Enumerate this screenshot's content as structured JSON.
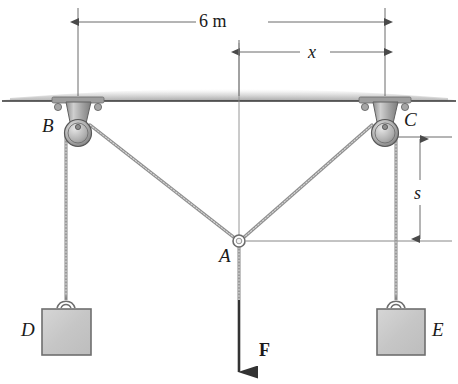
{
  "figure": {
    "colors": {
      "line": "#2b2b2b",
      "dim_line": "#5a5a5a",
      "cable": "#8a8a8a",
      "block_fill": "#c9c9c9",
      "block_stroke": "#6e6e6e",
      "pulley_fill": "#b5b5b5",
      "pulley_stroke": "#555555",
      "ceiling": "#333333",
      "hatch": "#b9b9b9"
    }
  },
  "labels": {
    "point_b": "B",
    "point_c": "C",
    "point_a": "A",
    "block_d": "D",
    "block_e": "E",
    "force": "F"
  },
  "dimensions": {
    "span": {
      "label": "6 m",
      "value": 6,
      "unit": "m",
      "from": "B",
      "to": "C"
    },
    "horizontal_offset": {
      "label": "x",
      "from": "centerline",
      "to": "C"
    },
    "vertical_drop": {
      "label": "s",
      "from": "C",
      "to": "A"
    }
  },
  "geometry": {
    "ceiling_y": 101,
    "pulley_b_x": 78,
    "pulley_c_x": 385,
    "point_a": {
      "x": 238,
      "y": 241
    },
    "centerline_x": 239,
    "span_dim_y": 22,
    "x_dim_y": 52,
    "s_dim_x": 420,
    "block_top_y": 310,
    "block_bottom_y": 355,
    "block_d_x": [
      42,
      91
    ],
    "block_e_x": [
      377,
      425
    ],
    "force_arrow_tip_y": 372
  }
}
